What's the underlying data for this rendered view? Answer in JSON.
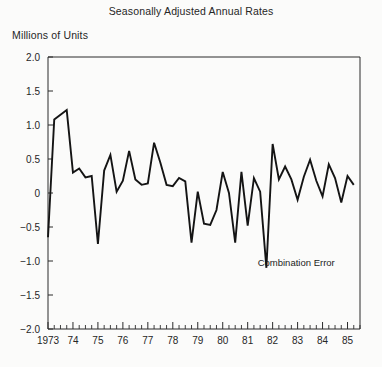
{
  "chart_data": {
    "type": "line",
    "title": "Seasonally Adjusted Annual Rates",
    "ylabel": "Millions of Units",
    "xlabel": "",
    "ylim": [
      -2.0,
      2.0
    ],
    "xlim": [
      1973.0,
      1985.5
    ],
    "grid": false,
    "legend": null,
    "ytick_labels": [
      "2.0",
      "1.5",
      "1.0",
      "0.5",
      "0",
      "-0.5",
      "-1.0",
      "-1.5",
      "-2.0"
    ],
    "ytick_values": [
      2.0,
      1.5,
      1.0,
      0.5,
      0,
      -0.5,
      -1.0,
      -1.5,
      -2.0
    ],
    "xtick_labels": [
      "1973",
      "74",
      "75",
      "76",
      "77",
      "78",
      "79",
      "80",
      "81",
      "82",
      "83",
      "84",
      "85"
    ],
    "xtick_values": [
      1973,
      1974,
      1975,
      1976,
      1977,
      1978,
      1979,
      1980,
      1981,
      1982,
      1983,
      1984,
      1985
    ],
    "minor_ticks_per_year": 4,
    "annotations": [
      {
        "text": "Combination Error",
        "x": 1981.4,
        "y": -1.02
      }
    ],
    "series": [
      {
        "name": "Seasonally Adjusted Annual Rate",
        "color": "#141414",
        "x": [
          1973.0,
          1973.25,
          1973.5,
          1973.75,
          1974.0,
          1974.25,
          1974.5,
          1974.75,
          1975.0,
          1975.25,
          1975.5,
          1975.75,
          1976.0,
          1976.25,
          1976.5,
          1976.75,
          1977.0,
          1977.25,
          1977.5,
          1977.75,
          1978.0,
          1978.25,
          1978.5,
          1978.75,
          1979.0,
          1979.25,
          1979.5,
          1979.75,
          1980.0,
          1980.25,
          1980.5,
          1980.75,
          1981.0,
          1981.25,
          1981.5,
          1981.75,
          1982.0,
          1982.25,
          1982.5,
          1982.75,
          1983.0,
          1983.25,
          1983.5,
          1983.75,
          1984.0,
          1984.25,
          1984.5,
          1984.75,
          1985.0,
          1985.25
        ],
        "y": [
          -0.65,
          1.08,
          1.15,
          1.22,
          0.3,
          0.36,
          0.23,
          0.25,
          -0.75,
          0.33,
          0.56,
          0.02,
          0.18,
          0.62,
          0.2,
          0.12,
          0.14,
          0.74,
          0.45,
          0.12,
          0.1,
          0.22,
          0.17,
          -0.73,
          0.02,
          -0.45,
          -0.47,
          -0.25,
          0.31,
          0.0,
          -0.73,
          0.31,
          -0.48,
          0.22,
          0.02,
          -1.1,
          0.72,
          0.2,
          0.39,
          0.2,
          -0.1,
          0.24,
          0.49,
          0.18,
          -0.05,
          0.42,
          0.22,
          -0.14,
          0.25,
          0.12
        ]
      }
    ]
  }
}
